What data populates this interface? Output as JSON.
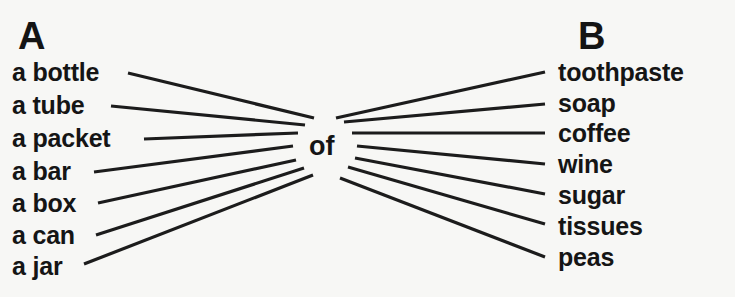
{
  "exercise": {
    "column_a": {
      "heading": "A",
      "items": [
        {
          "label": "a bottle"
        },
        {
          "label": "a tube"
        },
        {
          "label": "a packet"
        },
        {
          "label": "a bar"
        },
        {
          "label": "a box"
        },
        {
          "label": "a can"
        },
        {
          "label": "a jar"
        }
      ]
    },
    "connector": {
      "label": "of"
    },
    "column_b": {
      "heading": "B",
      "items": [
        {
          "label": "toothpaste"
        },
        {
          "label": "soap"
        },
        {
          "label": "coffee"
        },
        {
          "label": "wine"
        },
        {
          "label": "sugar"
        },
        {
          "label": "tissues"
        },
        {
          "label": "peas"
        }
      ]
    },
    "line_color": "#1c1c1c",
    "text_color": "#151515",
    "background_color": "#f7f7f5"
  }
}
